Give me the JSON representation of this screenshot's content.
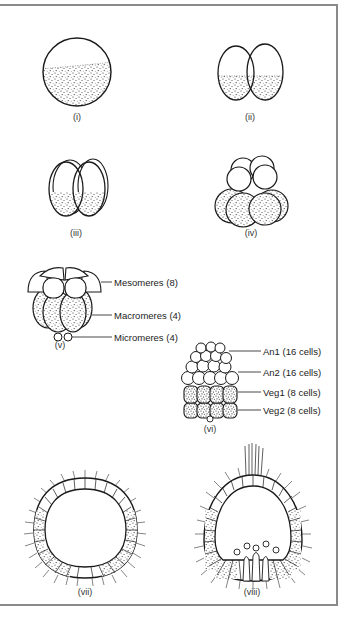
{
  "figure": {
    "stages": [
      {
        "id": "i",
        "label": "(i)",
        "x": 77,
        "y": 118
      },
      {
        "id": "ii",
        "label": "(ii)",
        "x": 250,
        "y": 118
      },
      {
        "id": "iii",
        "label": "(iii)",
        "x": 76,
        "y": 234
      },
      {
        "id": "iv",
        "label": "(iv)",
        "x": 251,
        "y": 234
      },
      {
        "id": "v",
        "label": "(v)",
        "x": 60,
        "y": 346
      },
      {
        "id": "vi",
        "label": "(vi)",
        "x": 210,
        "y": 430
      },
      {
        "id": "vii",
        "label": "(vii)",
        "x": 85,
        "y": 593
      },
      {
        "id": "viii",
        "label": "(viii)",
        "x": 252,
        "y": 593
      }
    ],
    "callouts_v": [
      {
        "text": "Mesomeres (8)",
        "y": 282
      },
      {
        "text": "Macromeres (4)",
        "y": 315
      },
      {
        "text": "Micromeres (4)",
        "y": 337
      }
    ],
    "callouts_vi": [
      {
        "text": "An1 (16 cells)",
        "y": 351
      },
      {
        "text": "An2 (16 cells)",
        "y": 372
      },
      {
        "text": "Veg1 (8 cells)",
        "y": 392
      },
      {
        "text": "Veg2 (8 cells)",
        "y": 410
      }
    ],
    "colors": {
      "stroke": "#1a1a1a",
      "frame": "#8a8a8a",
      "stipple": "#2a2a2a"
    }
  }
}
